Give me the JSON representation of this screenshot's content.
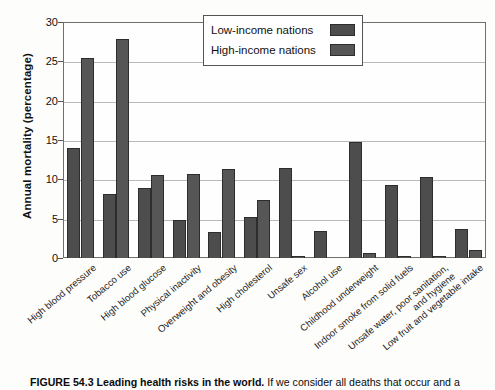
{
  "figure": {
    "caption_figure_number": "FIGURE 54.3",
    "caption_title": "Leading health risks in the world.",
    "caption_body": "If we consider all deaths that occur and a"
  },
  "legend": {
    "position": "top-center-right",
    "entries": [
      {
        "label": "Low-income nations",
        "color": "#4d4d4d",
        "swatch_name": "legend-swatch-low-income"
      },
      {
        "label": "High-income nations",
        "color": "#565656",
        "swatch_name": "legend-swatch-high-income"
      }
    ]
  },
  "chart_data": {
    "type": "bar",
    "title": "Leading health risks in the world",
    "xlabel": "",
    "ylabel": "Annual mortality (percentage)",
    "ylim": [
      0,
      30
    ],
    "yticks": [
      0,
      5,
      10,
      15,
      20,
      25,
      30
    ],
    "grid": true,
    "grid_orientation": "horizontal",
    "legend_position": "upper center",
    "categories": [
      "High blood pressure",
      "Tobacco use",
      "High blood glucose",
      "Physical inactivity",
      "Overweight and obesity",
      "High cholesterol",
      "Unsafe sex",
      "Alcohol use",
      "Childhood underweight",
      "Indoor smoke from solid fuels",
      "Unsafe water, poor sanitation, and hygiene",
      "Low fruit and vegetable intake"
    ],
    "category_lines": [
      [
        "High blood pressure"
      ],
      [
        "Tobacco use"
      ],
      [
        "High blood glucose"
      ],
      [
        "Physical inactivity"
      ],
      [
        "Overweight and obesity"
      ],
      [
        "High cholesterol"
      ],
      [
        "Unsafe sex"
      ],
      [
        "Alcohol use"
      ],
      [
        "Childhood underweight"
      ],
      [
        "Indoor smoke from solid fuels"
      ],
      [
        "Unsafe water, poor sanitation,",
        "and hygiene"
      ],
      [
        "Low fruit and vegetable intake"
      ]
    ],
    "series": [
      {
        "name": "Low-income nations",
        "color": "#4d4d4d",
        "values": [
          14.0,
          8.2,
          8.9,
          4.8,
          3.3,
          5.2,
          11.5,
          3.4,
          14.7,
          9.3,
          10.3,
          3.7
        ]
      },
      {
        "name": "High-income nations",
        "color": "#565656",
        "values": [
          25.4,
          27.9,
          10.6,
          10.7,
          11.3,
          7.4,
          0.3,
          0.0,
          0.7,
          0.2,
          0.2,
          1.0
        ]
      }
    ]
  }
}
